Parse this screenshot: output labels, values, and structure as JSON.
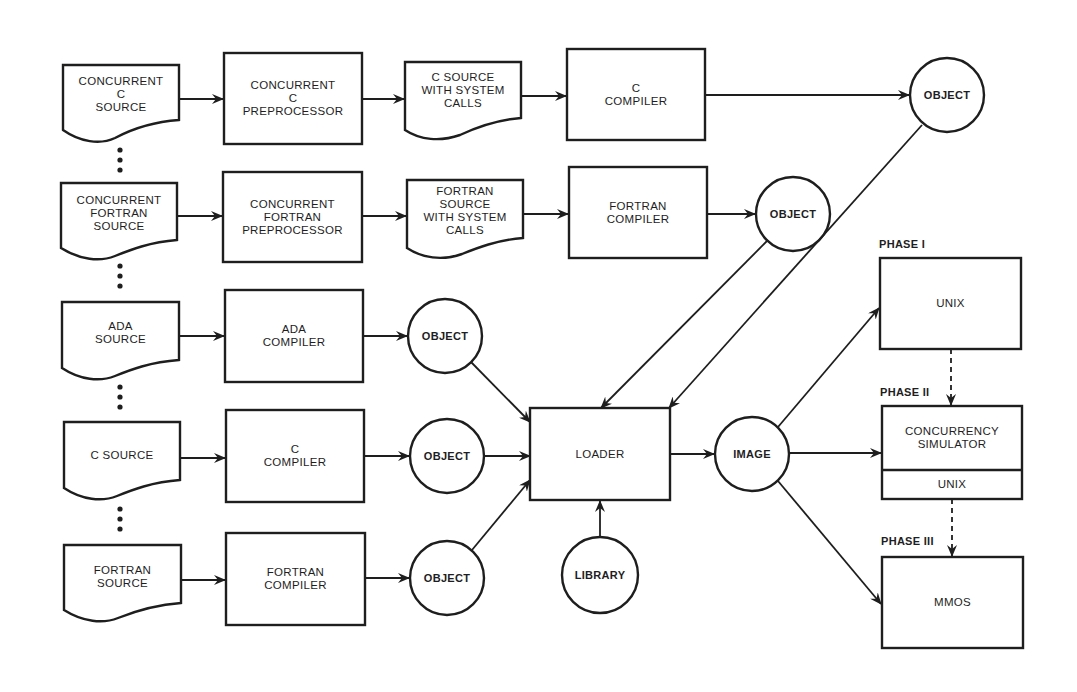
{
  "diagram": {
    "rows": [
      {
        "source": "CONCURRENT\nC\nSOURCE",
        "preprocessor": "CONCURRENT\nC\nPREPROCESSOR",
        "intermediate": "C SOURCE\nWITH SYSTEM\nCALLS",
        "compiler": "C\nCOMPILER",
        "object": "OBJECT"
      },
      {
        "source": "CONCURRENT\nFORTRAN\nSOURCE",
        "preprocessor": "CONCURRENT\nFORTRAN\nPREPROCESSOR",
        "intermediate": "FORTRAN\nSOURCE\nWITH SYSTEM\nCALLS",
        "compiler": "FORTRAN\nCOMPILER",
        "object": "OBJECT"
      },
      {
        "source": "ADA\nSOURCE",
        "compiler": "ADA\nCOMPILER",
        "object": "OBJECT"
      },
      {
        "source": "C SOURCE",
        "compiler": "C\nCOMPILER",
        "object": "OBJECT"
      },
      {
        "source": "FORTRAN\nSOURCE",
        "compiler": "FORTRAN\nCOMPILER",
        "object": "OBJECT"
      }
    ],
    "loader": "LOADER",
    "library": "LIBRARY",
    "image": "IMAGE",
    "phases": [
      {
        "label": "PHASE I",
        "box": "UNIX"
      },
      {
        "label": "PHASE II",
        "box": "CONCURRENCY\nSIMULATOR",
        "sub_box": "UNIX"
      },
      {
        "label": "PHASE III",
        "box": "MMOS"
      }
    ],
    "colors": {
      "ink": "#1e1e1e",
      "paper": "#ffffff"
    }
  }
}
